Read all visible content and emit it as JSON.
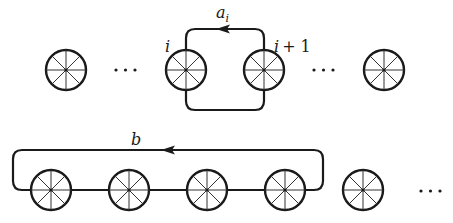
{
  "diagram": {
    "colors": {
      "stroke": "#1a1a1a",
      "spoke": "#333333",
      "background": "#ffffff"
    },
    "top_row": {
      "wheels": [
        {
          "id": "w1",
          "cx": 66,
          "cy": 70
        },
        {
          "id": "wi",
          "cx": 186,
          "cy": 70,
          "label": "i"
        },
        {
          "id": "wi1",
          "cx": 264,
          "cy": 70,
          "label": "i + 1"
        },
        {
          "id": "w4",
          "cx": 384,
          "cy": 70
        }
      ],
      "ellipses": [
        {
          "text": "· · ·",
          "x": 125,
          "y": 70
        },
        {
          "text": "· · ·",
          "x": 324,
          "y": 70
        }
      ],
      "loop": {
        "label": "a",
        "subscript": "i",
        "arrow_direction": "left"
      }
    },
    "bottom_row": {
      "wheels": [
        {
          "id": "b1",
          "cx": 51,
          "cy": 190
        },
        {
          "id": "b2",
          "cx": 129,
          "cy": 190
        },
        {
          "id": "b3",
          "cx": 207,
          "cy": 190
        },
        {
          "id": "b4",
          "cx": 285,
          "cy": 190
        },
        {
          "id": "b5",
          "cx": 363,
          "cy": 190
        }
      ],
      "ellipsis": {
        "text": "· · ·",
        "x": 430,
        "y": 191
      },
      "loop": {
        "label": "b",
        "arrow_direction": "left"
      }
    },
    "labels": {
      "wheel_i": "i",
      "wheel_i_plus_1_var": "i",
      "wheel_i_plus_1_rest": "+ 1",
      "loop_a": "a",
      "loop_a_sub": "i",
      "loop_b": "b"
    }
  }
}
